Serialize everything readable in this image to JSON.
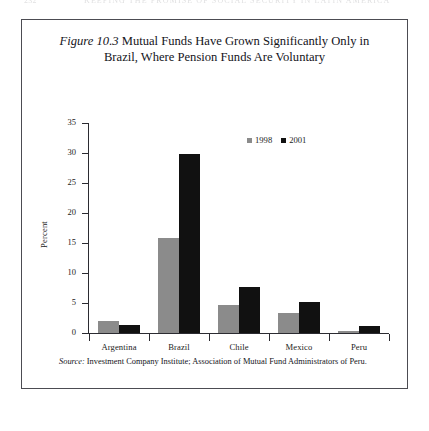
{
  "page": {
    "folio": "232",
    "running_head": "KEEPING THE PROMISE OF SOCIAL SECURITY IN LATIN AMERICA"
  },
  "figure": {
    "label": "Figure 10.3",
    "title_line1": "Mutual Funds Have Grown Significantly Only in",
    "title_line2": "Brazil, Where Pension Funds Are Voluntary",
    "source_label": "Source:",
    "source_text": "Investment Company Institute; Association of Mutual Fund Administrators of Peru."
  },
  "chart_data": {
    "type": "bar",
    "title": "Figure 10.3 Mutual Funds Have Grown Significantly Only in Brazil, Where Pension Funds Are Voluntary",
    "xlabel": "",
    "ylabel": "Percent",
    "ylim": [
      0,
      35
    ],
    "yticks": [
      0,
      5,
      10,
      15,
      20,
      25,
      30,
      35
    ],
    "ytick_labels": [
      "0",
      "5",
      "10",
      "15",
      "20",
      "25",
      "30",
      "35"
    ],
    "grid": false,
    "legend_position": "top-right",
    "categories": [
      "Argentina",
      "Brazil",
      "Chile",
      "Mexico",
      "Peru"
    ],
    "series": [
      {
        "name": "1998",
        "color": "#8b8b8b",
        "values": [
          2.0,
          15.9,
          4.7,
          3.3,
          0.4
        ]
      },
      {
        "name": "2001",
        "color": "#111111",
        "values": [
          1.4,
          29.8,
          7.7,
          5.2,
          1.2
        ]
      }
    ]
  }
}
